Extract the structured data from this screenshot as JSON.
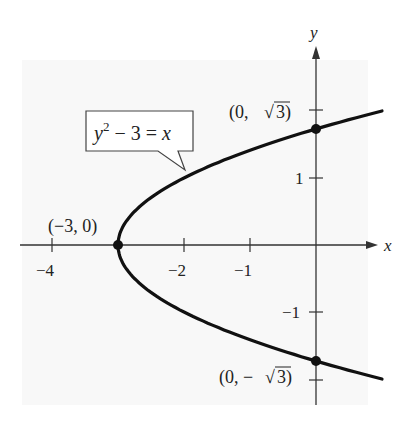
{
  "chart_data": {
    "type": "line",
    "title": "",
    "equation_label": "y² − 3 = x",
    "xlabel": "x",
    "ylabel": "y",
    "xlim": [
      -4.5,
      0.6
    ],
    "ylim": [
      -2.3,
      2.5
    ],
    "x_ticks": [
      -4,
      -2,
      -1
    ],
    "x_tick_labels": [
      "−4",
      "−2",
      "−1"
    ],
    "y_ticks": [
      1,
      -1
    ],
    "y_tick_labels": [
      "1",
      "−1"
    ],
    "grid": false,
    "series": [
      {
        "name": "y² − 3 = x",
        "curve": "parabola x = y² − 3",
        "y_range": [
          -2.0,
          2.0
        ]
      }
    ],
    "points": [
      {
        "label": "(−3, 0)",
        "x": -3,
        "y": 0
      },
      {
        "label": "(0, √3)",
        "x": 0,
        "y": 1.732
      },
      {
        "label": "(0, −√3)",
        "x": 0,
        "y": -1.732
      }
    ]
  },
  "labels": {
    "x_axis": "x",
    "y_axis": "y",
    "eq_y": "y",
    "eq_sup": "2",
    "eq_rest": " − 3 = ",
    "eq_x": "x",
    "pt_vertex": "(−3, 0)",
    "pt_top_a": "(0, ",
    "pt_top_b": "3)",
    "pt_bot_a": "(0, −",
    "pt_bot_b": "3)",
    "tick_x_m4": "−4",
    "tick_x_m2": "−2",
    "tick_x_m1": "−1",
    "tick_y_1": "1",
    "tick_y_m1": "−1"
  }
}
